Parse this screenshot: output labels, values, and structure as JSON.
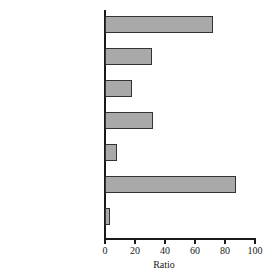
{
  "chart_data": {
    "type": "bar",
    "orientation": "horizontal",
    "title": "",
    "xlabel": "Ratio",
    "ylabel": "",
    "xlim": [
      0,
      100
    ],
    "xticks": [
      0,
      20,
      40,
      60,
      80,
      100
    ],
    "grid": false,
    "legend": null,
    "bar_color": "#a9a9a9",
    "bar_edge_color": "#333333",
    "axis_color": "#1a1a1a",
    "categories": [
      "Eating & drinking",
      "Motion pictures",
      "Food stores",
      "Printing & publishing",
      "Electrical equipment",
      "Educational services",
      "General merchandise"
    ],
    "values": [
      72,
      31,
      18,
      32,
      8,
      87,
      3
    ]
  },
  "ticks": [
    {
      "label": "0",
      "value": 0
    },
    {
      "label": "20",
      "value": 20
    },
    {
      "label": "40",
      "value": 40
    },
    {
      "label": "60",
      "value": 60
    },
    {
      "label": "80",
      "value": 80
    },
    {
      "label": "100",
      "value": 100
    }
  ],
  "axis": {
    "x_title": "Ratio"
  }
}
